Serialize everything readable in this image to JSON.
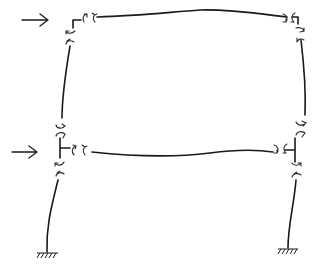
{
  "diagram": {
    "type": "structural-frame-deflected-shape",
    "colors": {
      "ink": "#1a1a1a",
      "background": "#ffffff"
    },
    "stories": 2,
    "bays": 1,
    "lateral_loads": [
      {
        "level": "roof",
        "direction": "right",
        "icon": "arrow-right-icon"
      },
      {
        "level": "first-floor",
        "direction": "right",
        "icon": "arrow-right-icon"
      }
    ],
    "supports": [
      {
        "position": "left-base",
        "type": "fixed",
        "icon": "fixed-support-icon"
      },
      {
        "position": "right-base",
        "type": "fixed",
        "icon": "fixed-support-icon"
      }
    ],
    "members": [
      {
        "name": "roof-beam",
        "kind": "beam"
      },
      {
        "name": "floor-beam",
        "kind": "beam"
      },
      {
        "name": "left-upper-column",
        "kind": "column"
      },
      {
        "name": "right-upper-column",
        "kind": "column"
      },
      {
        "name": "left-lower-column",
        "kind": "column"
      },
      {
        "name": "right-lower-column",
        "kind": "column"
      }
    ],
    "text_labels": []
  }
}
